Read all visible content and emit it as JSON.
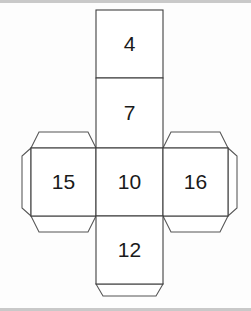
{
  "figure": {
    "type": "geometric-net",
    "shape": "cube net (cross layout)",
    "background_color": "#fdfdfd",
    "line_color": "#404040",
    "flap_line_color": "#555555",
    "label_color": "#1a1a1a",
    "border_color": "#c9c9c9"
  },
  "faces": [
    {
      "id": "top-face",
      "label": "4",
      "position": "top",
      "cx": 129.5,
      "cy": 41
    },
    {
      "id": "upper-face",
      "label": "7",
      "position": "upper",
      "cx": 129.5,
      "cy": 110
    },
    {
      "id": "left-face",
      "label": "15",
      "position": "left",
      "cx": 63.5,
      "cy": 179
    },
    {
      "id": "center-face",
      "label": "10",
      "position": "center",
      "cx": 129.5,
      "cy": 179
    },
    {
      "id": "right-face",
      "label": "16",
      "position": "right",
      "cx": 195.5,
      "cy": 179
    },
    {
      "id": "bottom-face",
      "label": "12",
      "position": "bottom",
      "cx": 129.5,
      "cy": 247
    }
  ],
  "flaps": [
    {
      "id": "flap-left-top",
      "attached_to": "left-face",
      "side": "top"
    },
    {
      "id": "flap-left-side",
      "attached_to": "left-face",
      "side": "left"
    },
    {
      "id": "flap-left-bottom",
      "attached_to": "left-face",
      "side": "bottom"
    },
    {
      "id": "flap-right-top",
      "attached_to": "right-face",
      "side": "top"
    },
    {
      "id": "flap-right-side",
      "attached_to": "right-face",
      "side": "right"
    },
    {
      "id": "flap-right-bottom",
      "attached_to": "right-face",
      "side": "bottom"
    },
    {
      "id": "flap-bottom",
      "attached_to": "bottom-face",
      "side": "bottom"
    }
  ]
}
